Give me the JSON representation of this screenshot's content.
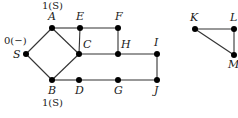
{
  "diagram": {
    "type": "graph",
    "nodes": [
      {
        "id": "S",
        "label": "S",
        "x": 26,
        "y": 54,
        "lx": 13,
        "ly": 58,
        "annotation": "0(−)",
        "ax": 4,
        "ay": 44
      },
      {
        "id": "A",
        "label": "A",
        "x": 52,
        "y": 28,
        "lx": 48,
        "ly": 20,
        "annotation": "1(S)",
        "ax": 42,
        "ay": 9
      },
      {
        "id": "E",
        "label": "E",
        "x": 80,
        "y": 28,
        "lx": 76,
        "ly": 20
      },
      {
        "id": "F",
        "label": "F",
        "x": 118,
        "y": 28,
        "lx": 115,
        "ly": 20
      },
      {
        "id": "C",
        "label": "C",
        "x": 79,
        "y": 54,
        "lx": 83,
        "ly": 48
      },
      {
        "id": "H",
        "label": "H",
        "x": 118,
        "y": 54,
        "lx": 121,
        "ly": 48
      },
      {
        "id": "I",
        "label": "I",
        "x": 157,
        "y": 54,
        "lx": 154,
        "ly": 46
      },
      {
        "id": "B",
        "label": "B",
        "x": 52,
        "y": 80,
        "lx": 48,
        "ly": 94,
        "annotation": "1(S)",
        "ax": 42,
        "ay": 106
      },
      {
        "id": "D",
        "label": "D",
        "x": 79,
        "y": 80,
        "lx": 75,
        "ly": 94
      },
      {
        "id": "G",
        "label": "G",
        "x": 118,
        "y": 80,
        "lx": 114,
        "ly": 94
      },
      {
        "id": "J",
        "label": "J",
        "x": 157,
        "y": 80,
        "lx": 154,
        "ly": 94
      },
      {
        "id": "K",
        "label": "K",
        "x": 195,
        "y": 29,
        "lx": 190,
        "ly": 21
      },
      {
        "id": "L",
        "label": "L",
        "x": 234,
        "y": 29,
        "lx": 230,
        "ly": 21
      },
      {
        "id": "M",
        "label": "M",
        "x": 234,
        "y": 55,
        "lx": 228,
        "ly": 68
      }
    ],
    "edges": [
      [
        "S",
        "A"
      ],
      [
        "S",
        "B"
      ],
      [
        "A",
        "E"
      ],
      [
        "A",
        "C"
      ],
      [
        "E",
        "F"
      ],
      [
        "E",
        "C"
      ],
      [
        "F",
        "H"
      ],
      [
        "C",
        "H"
      ],
      [
        "H",
        "I"
      ],
      [
        "I",
        "J"
      ],
      [
        "B",
        "C"
      ],
      [
        "B",
        "D"
      ],
      [
        "D",
        "G"
      ],
      [
        "G",
        "J"
      ],
      [
        "K",
        "L"
      ],
      [
        "K",
        "M"
      ],
      [
        "L",
        "M"
      ]
    ]
  }
}
